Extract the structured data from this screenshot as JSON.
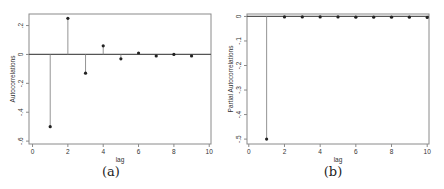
{
  "chart_data": [
    {
      "type": "line",
      "subtype": "stem",
      "title": "",
      "caption": "(a)",
      "xlabel": "lag",
      "ylabel": "Autocorrelations",
      "xlim": [
        -0.2,
        10.1
      ],
      "ylim": [
        -0.62,
        0.28
      ],
      "xticks": [
        0,
        2,
        4,
        6,
        8,
        10
      ],
      "xtick_labels": [
        "0",
        "2",
        "4",
        "6",
        "8",
        "10"
      ],
      "yticks": [
        0.2,
        0,
        -0.2,
        -0.4,
        -0.6
      ],
      "ytick_labels": [
        ".2",
        "0",
        "-.2",
        "-.4",
        "-.6"
      ],
      "grid": false,
      "zero_line": true,
      "x": [
        1,
        2,
        3,
        4,
        5,
        6,
        7,
        8,
        9
      ],
      "values": [
        -0.5,
        0.25,
        -0.13,
        0.06,
        -0.03,
        0.01,
        -0.01,
        0.0,
        -0.01
      ]
    },
    {
      "type": "line",
      "subtype": "stem",
      "title": "",
      "caption": "(b)",
      "xlabel": "lag",
      "ylabel": "Partial Autocorrelations",
      "xlim": [
        -0.1,
        10.1
      ],
      "ylim": [
        -0.52,
        0.01
      ],
      "xticks": [
        0,
        2,
        4,
        6,
        8,
        10
      ],
      "xtick_labels": [
        "0",
        "2",
        "4",
        "6",
        "8",
        "10"
      ],
      "yticks": [
        0,
        -0.1,
        -0.2,
        -0.3,
        -0.4,
        -0.5
      ],
      "ytick_labels": [
        "0",
        "-.1",
        "-.2",
        "-.3",
        "-.4",
        "-.5"
      ],
      "grid": false,
      "zero_line": true,
      "x": [
        1,
        2,
        3,
        4,
        5,
        6,
        7,
        8,
        9,
        10
      ],
      "values": [
        -0.5,
        -0.002,
        -0.002,
        -0.002,
        -0.002,
        -0.003,
        -0.003,
        -0.003,
        -0.003,
        -0.004
      ]
    }
  ],
  "captions": {
    "a": "(a)",
    "b": "(b)"
  }
}
